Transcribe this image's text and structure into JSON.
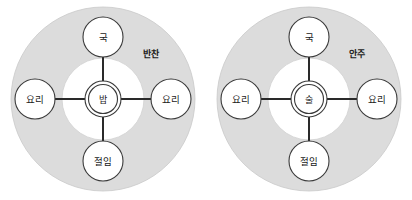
{
  "figure": {
    "type": "concentric-relationship-diagram",
    "background_color": "#ffffff",
    "diagram_count": 2,
    "outer_ring_color": "#dcdcdc",
    "inner_disc_color": "#ffffff",
    "node_fill_color": "#ffffff",
    "node_stroke_color": "#3a3a3a",
    "spoke_color": "#2a2a2a",
    "text_color": "#1a1a1a"
  },
  "diagrams": [
    {
      "id": "meal-structure",
      "ring_label": "반찬",
      "center": {
        "label": "밥"
      },
      "nodes": [
        {
          "position": "top",
          "label": "국"
        },
        {
          "position": "left",
          "label": "요리"
        },
        {
          "position": "right",
          "label": "요리"
        },
        {
          "position": "bottom",
          "label": "절임"
        }
      ]
    },
    {
      "id": "drink-structure",
      "ring_label": "안주",
      "center": {
        "label": "술"
      },
      "nodes": [
        {
          "position": "top",
          "label": "국"
        },
        {
          "position": "left",
          "label": "요리"
        },
        {
          "position": "right",
          "label": "요리"
        },
        {
          "position": "bottom",
          "label": "절임"
        }
      ]
    }
  ]
}
